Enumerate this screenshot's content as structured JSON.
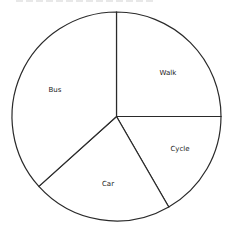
{
  "chart_data": {
    "type": "pie",
    "title": "",
    "start_angle_deg": 0,
    "direction": "clockwise",
    "categories": [
      "Walk",
      "Cycle",
      "Car",
      "Bus"
    ],
    "values": [
      15,
      10,
      13,
      22
    ],
    "angles_deg": [
      90,
      60,
      78,
      132
    ],
    "colors": [
      "#ffffff",
      "#ffffff",
      "#ffffff",
      "#ffffff"
    ],
    "stroke": "#2a2a2a",
    "legend": "none (labels inside slices)"
  },
  "labels": {
    "walk": "Walk",
    "cycle": "Cycle",
    "car": "Car",
    "bus": "Bus"
  }
}
